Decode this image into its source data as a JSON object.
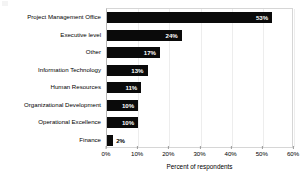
{
  "chart_data": {
    "type": "bar",
    "orientation": "horizontal",
    "title": "",
    "xlabel": "Percent of respondents",
    "ylabel": "",
    "xlim": [
      0,
      60
    ],
    "xticks": [
      "0%",
      "10%",
      "20%",
      "30%",
      "40%",
      "50%",
      "60%"
    ],
    "xtick_values": [
      0,
      10,
      20,
      30,
      40,
      50,
      60
    ],
    "grid": true,
    "legend": false,
    "bar_color": "#0a0a0a",
    "categories": [
      "Project Management Office",
      "Executive level",
      "Other",
      "Information Technology",
      "Human Resources",
      "Organizational Development",
      "Operational Excellence",
      "Finance"
    ],
    "values": [
      53,
      24,
      17,
      13,
      11,
      10,
      10,
      2
    ],
    "data_labels": [
      "53%",
      "24%",
      "17%",
      "13%",
      "11%",
      "10%",
      "10%",
      "2%"
    ],
    "label_placement": [
      "inside",
      "inside",
      "inside",
      "inside",
      "inside",
      "inside",
      "inside",
      "outside"
    ]
  }
}
